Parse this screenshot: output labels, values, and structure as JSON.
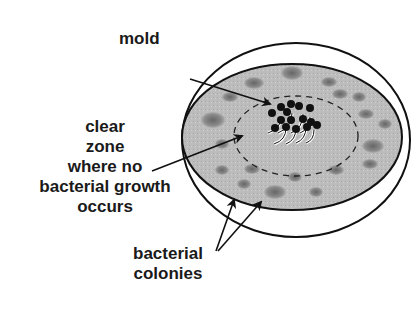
{
  "diagram": {
    "labels": {
      "mold": "mold",
      "clear_zone": [
        "clear",
        "zone",
        "where no",
        "bacterial growth",
        "occurs"
      ],
      "bacterial_colonies": [
        "bacterial",
        "colonies"
      ]
    },
    "colors": {
      "agar": "#b9b9b9",
      "colony": "#7a7a7a",
      "outline": "#111111",
      "text": "#1a1a1a"
    }
  }
}
